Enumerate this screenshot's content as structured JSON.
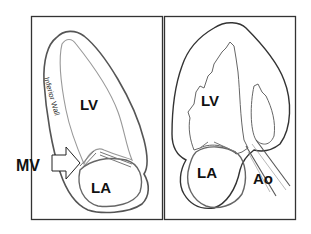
{
  "figure": {
    "panels": [
      {
        "id": "left",
        "view": "apical two-chamber",
        "labels": {
          "lv": "LV",
          "la": "LA",
          "wall": "Inferior Wall",
          "valve": "MV"
        }
      },
      {
        "id": "right",
        "view": "apical three-chamber",
        "labels": {
          "lv": "LV",
          "la": "LA",
          "aorta": "Ao"
        }
      }
    ],
    "colors": {
      "frame": "#333333",
      "outline": "#555555",
      "inner_line": "#888888",
      "text": "#111111",
      "background": "#ffffff"
    }
  }
}
